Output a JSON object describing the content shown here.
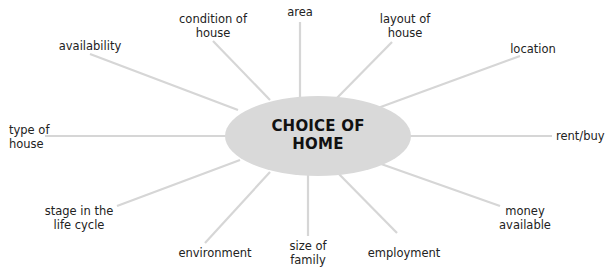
{
  "diagram": {
    "center": {
      "label": "CHOICE OF\nHOME",
      "fill": "#d9d9d9"
    },
    "line_color": "#d6d6d6",
    "nodes": [
      {
        "id": "condition-of-house",
        "label": "condition of\nhouse"
      },
      {
        "id": "area",
        "label": "area"
      },
      {
        "id": "layout-of-house",
        "label": "layout of\nhouse"
      },
      {
        "id": "availability",
        "label": "availability"
      },
      {
        "id": "location",
        "label": "location"
      },
      {
        "id": "type-of-house",
        "label": "type of\nhouse"
      },
      {
        "id": "rent-buy",
        "label": "rent/buy"
      },
      {
        "id": "stage-in-life-cycle",
        "label": "stage in the\nlife cycle"
      },
      {
        "id": "money-available",
        "label": "money\navailable"
      },
      {
        "id": "environment",
        "label": "environment"
      },
      {
        "id": "size-of-family",
        "label": "size of\nfamily"
      },
      {
        "id": "employment",
        "label": "employment"
      }
    ]
  }
}
